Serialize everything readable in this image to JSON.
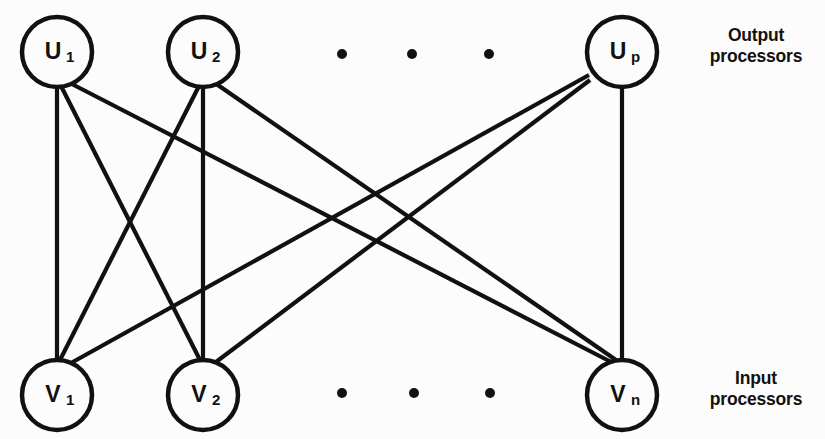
{
  "diagram": {
    "type": "bipartite-graph",
    "background_color": "#fcfcfc",
    "stroke_color": "#111111",
    "node_radius": 35,
    "edge_width": 4.2
  },
  "labels": {
    "output_line1": "Output",
    "output_line2": "processors",
    "input_line1": "Input",
    "input_line2": "processors"
  },
  "nodes": {
    "output": [
      {
        "id": "U1",
        "base": "U",
        "sub": "1",
        "cx": 57,
        "cy": 52
      },
      {
        "id": "U2",
        "base": "U",
        "sub": "2",
        "cx": 203,
        "cy": 52
      },
      {
        "id": "Up",
        "base": "U",
        "sub": "p",
        "cx": 622,
        "cy": 52
      }
    ],
    "input": [
      {
        "id": "V1",
        "base": "V",
        "sub": "1",
        "cx": 57,
        "cy": 395
      },
      {
        "id": "V2",
        "base": "V",
        "sub": "2",
        "cx": 203,
        "cy": 395
      },
      {
        "id": "Vn",
        "base": "V",
        "sub": "n",
        "cx": 622,
        "cy": 395
      }
    ]
  },
  "edges": [
    {
      "from": "U1",
      "to": "V1",
      "x1": 57,
      "y1": 87,
      "x2": 57,
      "y2": 360
    },
    {
      "from": "U1",
      "to": "V2",
      "x1": 61,
      "y1": 86,
      "x2": 200,
      "y2": 360
    },
    {
      "from": "U1",
      "to": "Vn",
      "x1": 66,
      "y1": 81,
      "x2": 615,
      "y2": 364
    },
    {
      "from": "U2",
      "to": "V1",
      "x1": 199,
      "y1": 86,
      "x2": 60,
      "y2": 360
    },
    {
      "from": "U2",
      "to": "V2",
      "x1": 203,
      "y1": 87,
      "x2": 203,
      "y2": 360
    },
    {
      "from": "U2",
      "to": "Vn",
      "x1": 212,
      "y1": 81,
      "x2": 616,
      "y2": 360
    },
    {
      "from": "Up",
      "to": "V1",
      "x1": 589,
      "y1": 75,
      "x2": 62,
      "y2": 368
    },
    {
      "from": "Up",
      "to": "V2",
      "x1": 590,
      "y1": 80,
      "x2": 208,
      "y2": 368
    },
    {
      "from": "Up",
      "to": "Vn",
      "x1": 622,
      "y1": 87,
      "x2": 622,
      "y2": 360
    }
  ],
  "ellipsis": {
    "top": [
      {
        "cx": 342,
        "cy": 54
      },
      {
        "cx": 412,
        "cy": 54
      },
      {
        "cx": 489,
        "cy": 54
      }
    ],
    "bottom": [
      {
        "cx": 342,
        "cy": 393
      },
      {
        "cx": 414,
        "cy": 393
      },
      {
        "cx": 490,
        "cy": 393
      }
    ],
    "radius": 5
  }
}
